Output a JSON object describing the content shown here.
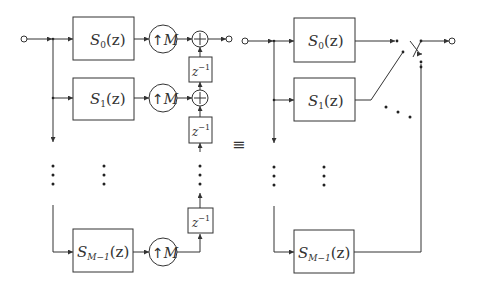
{
  "diagram": {
    "left": {
      "filters": [
        {
          "name": "S",
          "subscript": "0",
          "arg": "(z)"
        },
        {
          "name": "S",
          "subscript": "1",
          "arg": "(z)"
        },
        {
          "name": "S",
          "subscript": "M−1",
          "arg": "(z)"
        }
      ],
      "upsampler": {
        "arrow": "↑",
        "factor": "M"
      },
      "delay": {
        "base": "z",
        "exponent": "−1"
      },
      "adder": "+"
    },
    "equivalence": "≡",
    "right": {
      "filters": [
        {
          "name": "S",
          "subscript": "0",
          "arg": "(z)"
        },
        {
          "name": "S",
          "subscript": "1",
          "arg": "(z)"
        },
        {
          "name": "S",
          "subscript": "M−1",
          "arg": "(z)"
        }
      ],
      "switch": "commutator"
    },
    "ellipsis_vertical": "⋮",
    "ellipsis_diagonal": "⋱"
  }
}
